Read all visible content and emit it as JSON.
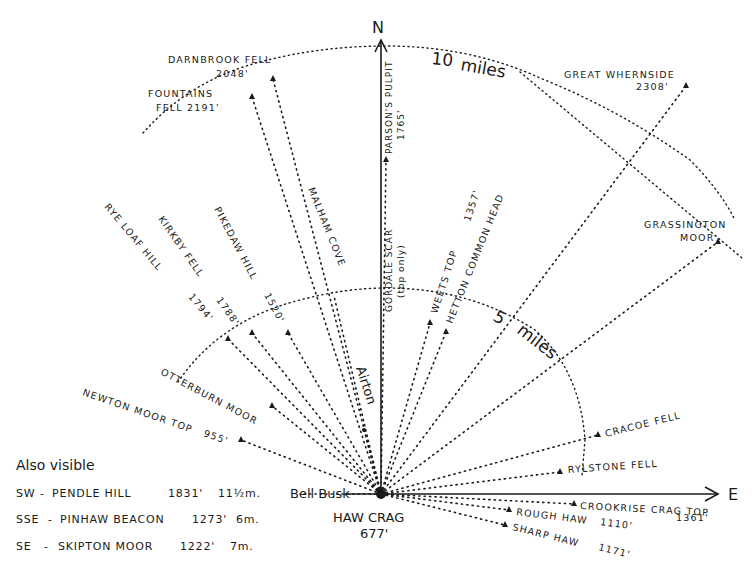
{
  "diagram": {
    "ink_color": "#1a1a1a",
    "background": "#ffffff",
    "origin": {
      "name": "HAW CRAG",
      "height": "677'",
      "x": 381,
      "y": 494
    },
    "axes": {
      "north_label": "N",
      "east_label": "E"
    },
    "rings": [
      {
        "label": "5",
        "unit": "miles",
        "radius_px": 200
      },
      {
        "label": "10",
        "unit": "miles",
        "radius_px": 450
      }
    ],
    "places": {
      "bell_busk": "Bell Busk",
      "airton": "Airton"
    },
    "peaks": [
      {
        "id": "darnbrook",
        "name": "DARNBROOK FELL",
        "height": "2048'",
        "x": 273,
        "y": 79
      },
      {
        "id": "fountains",
        "name": "FOUNTAINS",
        "name2": "FELL 2191'",
        "x": 252,
        "y": 97
      },
      {
        "id": "parsons",
        "name": "PARSON'S PULPIT",
        "height": "1765'",
        "x": 386,
        "y": 160
      },
      {
        "id": "great_whernside",
        "name": "GREAT WHERNSIDE",
        "height": "2308'",
        "x": 686,
        "y": 86
      },
      {
        "id": "grassington",
        "name": "GRASSINGTON",
        "name2": "MOOR",
        "x": 718,
        "y": 242
      },
      {
        "id": "malham",
        "name": "MALHAM COVE",
        "x": 334,
        "y": 296
      },
      {
        "id": "gordale",
        "name": "GORDALE SCAR",
        "note": "(top only)",
        "x": 386,
        "y": 312
      },
      {
        "id": "weets",
        "name": "WEETS TOP",
        "height": "1357'",
        "x": 430,
        "y": 323
      },
      {
        "id": "hetton",
        "name": "HETTON COMMON HEAD",
        "x": 446,
        "y": 332
      },
      {
        "id": "pikedaw",
        "name": "PIKEDAW HILL",
        "height": "1520'",
        "x": 288,
        "y": 333
      },
      {
        "id": "kirkby",
        "name": "KIRKBY FELL",
        "height": "1788'",
        "x": 252,
        "y": 333
      },
      {
        "id": "rye_loaf",
        "name": "RYE LOAF HILL",
        "height": "1794'",
        "x": 228,
        "y": 339
      },
      {
        "id": "otterburn",
        "name": "OTTERBURN MOOR",
        "x": 272,
        "y": 406
      },
      {
        "id": "newton",
        "name": "NEWTON MOOR TOP",
        "height": "955'",
        "x": 241,
        "y": 440
      },
      {
        "id": "cracoe",
        "name": "CRACOE FELL",
        "x": 598,
        "y": 435
      },
      {
        "id": "rylstone",
        "name": "RYLSTONE FELL",
        "x": 560,
        "y": 472
      },
      {
        "id": "crookrise",
        "name": "CROOKRISE CRAG TOP",
        "height": "1361'",
        "x": 574,
        "y": 504
      },
      {
        "id": "rough_haw",
        "name": "ROUGH HAW",
        "height": "1110'",
        "x": 509,
        "y": 510
      },
      {
        "id": "sharp_haw",
        "name": "SHARP HAW",
        "height": "1171'",
        "x": 505,
        "y": 525
      }
    ],
    "also_visible": {
      "heading": "Also visible",
      "items": [
        {
          "bearing": "SW",
          "name": "PENDLE HILL",
          "height": "1831'",
          "distance": "11½m."
        },
        {
          "bearing": "SSE",
          "name": "PINHAW BEACON",
          "height": "1273'",
          "distance": "6m."
        },
        {
          "bearing": "SE",
          "name": "SKIPTON MOOR",
          "height": "1222'",
          "distance": "7m."
        }
      ]
    }
  }
}
